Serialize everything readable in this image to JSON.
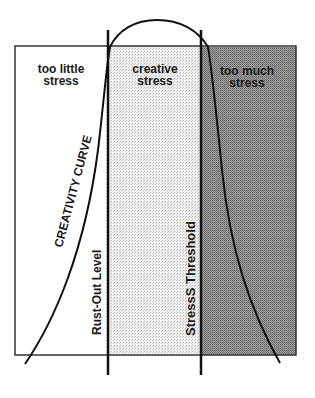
{
  "diagram": {
    "zones": [
      {
        "id": "low",
        "label_line1": "too little",
        "label_line2": "stress",
        "fill": "#ffffff"
      },
      {
        "id": "mid",
        "label_line1": "creative",
        "label_line2": "stress",
        "fill": "#e4e4e4"
      },
      {
        "id": "high",
        "label_line1": "too much",
        "label_line2": "stress",
        "fill": "#8f8f8f"
      }
    ],
    "curve_label": "CREATIVITY CURVE",
    "left_line_label": "Rust-Out Level",
    "right_line_label": "StressS Threshold",
    "colors": {
      "stroke": "#111111",
      "box_border": "#333333"
    }
  }
}
